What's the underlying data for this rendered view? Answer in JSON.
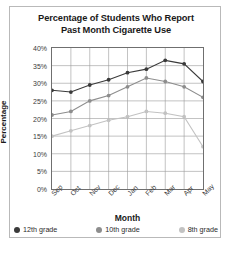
{
  "chart_data": {
    "type": "line",
    "title": "Percentage of Students Who Report Past Month Cigarette Use",
    "title_line1": "Percentage of Students Who Report",
    "title_line2": "Past Month Cigarette Use",
    "xlabel": "Month",
    "ylabel": "Percentage",
    "categories": [
      "Sep",
      "Oct",
      "Nov",
      "Dec",
      "Jan",
      "Feb",
      "Mar",
      "Apr",
      "May"
    ],
    "ylim": [
      0,
      40
    ],
    "ytick_step": 5,
    "ytick_labels": [
      "40%",
      "35%",
      "30%",
      "25%",
      "20%",
      "15%",
      "10%",
      "5%",
      "0%"
    ],
    "ytick_values": [
      40,
      35,
      30,
      25,
      20,
      15,
      10,
      5,
      0
    ],
    "grid": true,
    "legend_position": "bottom",
    "series": [
      {
        "name": "12th grade",
        "color": "#3a3a3a",
        "values": [
          28,
          27.5,
          29.5,
          31,
          33,
          34,
          36.5,
          35.5,
          30.5
        ]
      },
      {
        "name": "10th grade",
        "color": "#8d8d8d",
        "values": [
          21,
          22,
          25,
          26.5,
          29,
          31.5,
          30.5,
          29,
          26
        ]
      },
      {
        "name": "8th grade",
        "color": "#c2c2c2",
        "values": [
          15,
          16.5,
          18,
          19.5,
          20.5,
          22,
          21.5,
          20.5,
          12
        ]
      }
    ]
  }
}
